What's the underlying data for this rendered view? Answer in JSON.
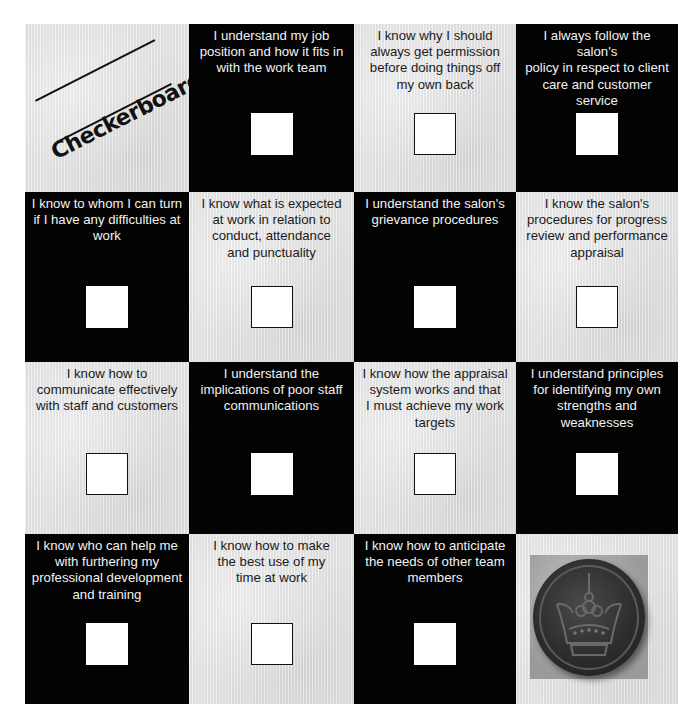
{
  "title": "Checkerboard",
  "cells": [
    {
      "row": 0,
      "col": 0,
      "type": "title",
      "shade": "light"
    },
    {
      "row": 0,
      "col": 1,
      "type": "statement",
      "shade": "dark",
      "lines": [
        "I understand my job",
        "position and how it fits in",
        "with the work team"
      ],
      "checked": false
    },
    {
      "row": 0,
      "col": 2,
      "type": "statement",
      "shade": "light",
      "lines": [
        "I know why I should",
        "always get permission",
        "before doing things off",
        "my own back"
      ],
      "checked": false
    },
    {
      "row": 0,
      "col": 3,
      "type": "statement",
      "shade": "dark",
      "lines": [
        "I always follow the salon's",
        "policy in respect to client",
        "care and customer",
        "service"
      ],
      "checked": false
    },
    {
      "row": 1,
      "col": 0,
      "type": "statement",
      "shade": "dark",
      "lines": [
        "I know to whom I can turn",
        "if I have any difficulties at",
        "work"
      ],
      "checked": false
    },
    {
      "row": 1,
      "col": 1,
      "type": "statement",
      "shade": "light",
      "lines": [
        "I know what is expected",
        "at work in relation to",
        "conduct, attendance",
        "and punctuality"
      ],
      "checked": false
    },
    {
      "row": 1,
      "col": 2,
      "type": "statement",
      "shade": "dark",
      "lines": [
        "I understand the salon's",
        "grievance procedures"
      ],
      "checked": false
    },
    {
      "row": 1,
      "col": 3,
      "type": "statement",
      "shade": "light",
      "lines": [
        "I know the salon's",
        "procedures for progress",
        "review and performance",
        "appraisal"
      ],
      "checked": false
    },
    {
      "row": 2,
      "col": 0,
      "type": "statement",
      "shade": "light",
      "lines": [
        "I know how to",
        "communicate effectively",
        "with staff and customers"
      ],
      "checked": false
    },
    {
      "row": 2,
      "col": 1,
      "type": "statement",
      "shade": "dark",
      "lines": [
        "I understand the",
        "implications of poor staff",
        "communications"
      ],
      "checked": false
    },
    {
      "row": 2,
      "col": 2,
      "type": "statement",
      "shade": "light",
      "lines": [
        "I know how the appraisal",
        "system works and that",
        "I must achieve my work",
        "targets"
      ],
      "checked": false
    },
    {
      "row": 2,
      "col": 3,
      "type": "statement",
      "shade": "dark",
      "lines": [
        "I understand principles",
        "for identifying my own",
        "strengths and",
        "weaknesses"
      ],
      "checked": false
    },
    {
      "row": 3,
      "col": 0,
      "type": "statement",
      "shade": "dark",
      "lines": [
        "I know who can help me",
        "with furthering my",
        "professional development",
        "and training"
      ],
      "checked": false
    },
    {
      "row": 3,
      "col": 1,
      "type": "statement",
      "shade": "light",
      "lines": [
        "I know how to make",
        "the best use of my",
        "time at work"
      ],
      "checked": false
    },
    {
      "row": 3,
      "col": 2,
      "type": "statement",
      "shade": "dark",
      "lines": [
        "I know how to anticipate",
        "the needs of other team",
        "members"
      ],
      "checked": false
    },
    {
      "row": 3,
      "col": 3,
      "type": "image",
      "shade": "light",
      "image": "crown-badge-icon"
    }
  ],
  "colors": {
    "dark": "#030303",
    "light": "#e4e4e4",
    "checkbox": "#ffffff"
  }
}
